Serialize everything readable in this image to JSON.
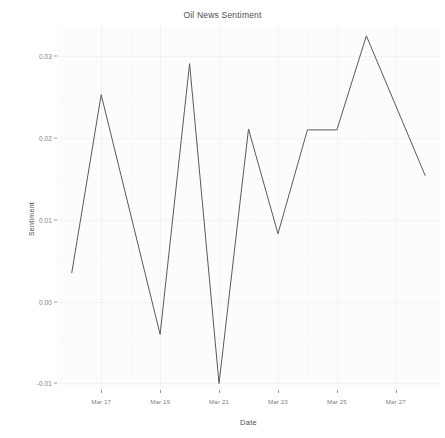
{
  "chart_data": {
    "type": "line",
    "title": "Oil News Sentiment",
    "xlabel": "Date",
    "ylabel": "Sentiment",
    "grid": true,
    "legend": "none",
    "line_color": "#595959",
    "panel_color": "#fcfcfc",
    "grid_color": "#f2f2f2",
    "x": [
      "Mar 16",
      "Mar 17",
      "Mar 19",
      "Mar 20",
      "Mar 21",
      "Mar 22",
      "Mar 23",
      "Mar 24",
      "Mar 25",
      "Mar 26",
      "Mar 28"
    ],
    "values": [
      0.0035,
      0.0253,
      -0.004,
      0.0291,
      -0.01,
      0.0211,
      0.0083,
      0.021,
      0.021,
      0.0325,
      0.0154
    ],
    "x_numeric": [
      16,
      17,
      19,
      20,
      21,
      22,
      23,
      24,
      25,
      26,
      28
    ],
    "xlim": [
      15.5,
      28.5
    ],
    "ylim": [
      -0.0108,
      0.0337
    ],
    "yticks": [
      0.03,
      0.02,
      0.01,
      0.0,
      -0.01
    ],
    "ytick_labels": [
      "0.03",
      "0.02",
      "0.01",
      "0.00",
      "-0.01"
    ],
    "xticks": [
      17,
      19,
      21,
      23,
      25,
      27
    ],
    "xtick_labels": [
      "Mar 17",
      "Mar 19",
      "Mar 21",
      "Mar 23",
      "Mar 25",
      "Mar 27"
    ]
  }
}
